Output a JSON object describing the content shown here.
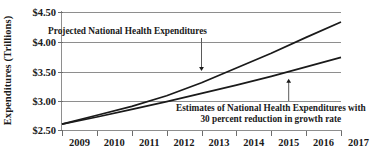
{
  "chart_data": {
    "type": "line",
    "title": "",
    "xlabel": "",
    "ylabel": "Expenditures (Trillions)",
    "x": [
      2009,
      2010,
      2011,
      2012,
      2013,
      2014,
      2015,
      2016,
      2017
    ],
    "xtick_labels": [
      "2009",
      "2010",
      "2011",
      "2012",
      "2013",
      "2014",
      "2015",
      "2016",
      "2017"
    ],
    "ytick_labels": [
      "$2.50",
      "$3.00",
      "$3.50",
      "$4.00",
      "$4.50"
    ],
    "ytick_values": [
      2.5,
      3.0,
      3.5,
      4.0,
      4.5
    ],
    "ylim": [
      2.5,
      4.5
    ],
    "xlim": [
      2009,
      2017
    ],
    "grid": true,
    "legend_position": "none",
    "series": [
      {
        "name": "Projected National Health Expenditures",
        "values": [
          2.6,
          2.75,
          2.9,
          3.08,
          3.3,
          3.55,
          3.8,
          4.07,
          4.33
        ]
      },
      {
        "name": "Estimates of National Health Expenditures with 30 percent reduction in growth rate",
        "values": [
          2.6,
          2.72,
          2.85,
          2.98,
          3.12,
          3.26,
          3.41,
          3.57,
          3.73
        ]
      }
    ],
    "annotations": [
      {
        "id": "projected",
        "text": "Projected National Health Expenditures",
        "points_to_x": 2013,
        "points_to_y": 3.5,
        "arrow_direction": "down"
      },
      {
        "id": "estimates",
        "line1": "Estimates of National Health Expenditures with",
        "line2": "30 percent reduction in growth rate",
        "points_to_x": 2015.5,
        "points_to_y": 3.37,
        "arrow_direction": "up"
      }
    ],
    "colors": {
      "series_line": "#1a1a1a",
      "gridline": "#8e8e8e",
      "text": "#1a1a1a",
      "background": "#ffffff"
    }
  }
}
